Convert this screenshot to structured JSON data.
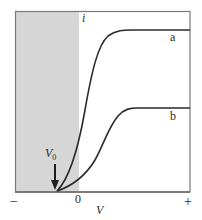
{
  "figure": {
    "type": "current-voltage characteristic",
    "y_axis_label": "i",
    "x_axis_label": "V",
    "x_tick_labels": {
      "negative": "−",
      "zero": "0",
      "positive": "+"
    },
    "threshold_label": "V",
    "threshold_subscript": "0",
    "shaded_region": "V < 0 (negative voltage side)",
    "curves": [
      {
        "id": "a",
        "label": "a",
        "description": "higher saturation current"
      },
      {
        "id": "b",
        "label": "b",
        "description": "lower saturation current"
      }
    ],
    "colors": {
      "shade": "#d6d6d6",
      "frame": "#7a7a7a",
      "curve": "#2b2b2b",
      "text": "#2a2a2a",
      "background": "#ffffff"
    }
  }
}
